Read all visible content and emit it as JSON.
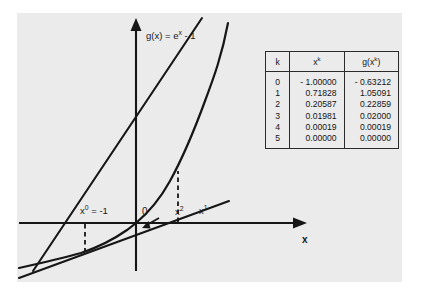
{
  "figure": {
    "curve_label": "g(x) = e",
    "curve_label_sup": "x",
    "curve_label_tail": " - 1",
    "origin_label": "0",
    "x_axis_label": "x",
    "label_x0_base": "x",
    "label_x0_sup": "0",
    "label_x0_tail": " = -1",
    "label_x1_base": "x",
    "label_x1_sup": "1",
    "label_x2_base": "x",
    "label_x2_sup": "2",
    "background": "#ebebeb",
    "ink": "#141414"
  },
  "table": {
    "headers": {
      "k": "k",
      "xk_base": "x",
      "xk_sup": "k",
      "gxk_pre": "g(x",
      "gxk_sup": "k",
      "gxk_post": ")"
    },
    "rows": [
      {
        "k": "0",
        "xk": "- 1.00000",
        "gxk": "- 0.63212"
      },
      {
        "k": "1",
        "xk": "0.71828",
        "gxk": "1.05091"
      },
      {
        "k": "2",
        "xk": "0.20587",
        "gxk": "0.22859"
      },
      {
        "k": "3",
        "xk": "0.01981",
        "gxk": "0.02000"
      },
      {
        "k": "4",
        "xk": "0.00019",
        "gxk": "0.00019"
      },
      {
        "k": "5",
        "xk": "0.00000",
        "gxk": "0.00000"
      }
    ]
  },
  "chart_data": {
    "type": "line",
    "xlabel": "x",
    "ylabel": "",
    "grid": false,
    "legend": "none",
    "series": [
      {
        "name": "g(x) = e^x - 1",
        "type": "curve",
        "x": [
          -3.0,
          -2.5,
          -2.0,
          -1.5,
          -1.0,
          -0.5,
          0.0,
          0.3,
          0.6,
          0.9,
          1.2,
          1.5,
          1.8
        ],
        "y": [
          -0.9502,
          -0.9179,
          -0.8647,
          -0.7769,
          -0.6321,
          -0.3935,
          0.0,
          0.3499,
          0.8221,
          1.4596,
          2.3201,
          3.4817,
          5.0496
        ]
      },
      {
        "name": "tangent at x0 = -1",
        "type": "line",
        "x": [
          -3.4,
          2.4
        ],
        "y": [
          -1.5149,
          0.6185
        ],
        "root": 0.71828
      },
      {
        "name": "tangent at x1 = 0.71828",
        "type": "line",
        "x": [
          -3.4,
          1.45
        ],
        "y": [
          -7.4,
          2.55
        ],
        "root": 0.20587
      }
    ],
    "markers": [
      {
        "label": "x^0 = -1",
        "x": -1.0,
        "y": 0
      },
      {
        "label": "x^1",
        "x": 0.71828,
        "y": 0
      },
      {
        "label": "x^2",
        "x": 0.20587,
        "y": 0
      }
    ],
    "dashed_drops": [
      {
        "x": -1.0,
        "from_y": 0,
        "to_y": -0.63212
      },
      {
        "x": 0.71828,
        "from_y": 0,
        "to_y": 1.05091
      }
    ],
    "axis_origin_label": "0"
  }
}
